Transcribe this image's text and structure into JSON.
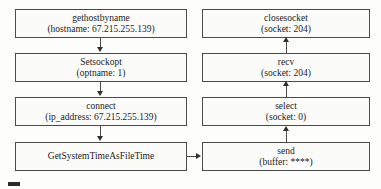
{
  "diagram": {
    "columns": {
      "left": {
        "name": "outbound-connection-sequence",
        "nodes": [
          {
            "title": "gethostbyname",
            "sub": "(hostname: 67.215.255.139)"
          },
          {
            "title": "Setsockopt",
            "sub": "(optname: 1)"
          },
          {
            "title": "connect",
            "sub": "(ip_address: 67.215.255.139)"
          },
          {
            "title": "GetSystemTimeAsFileTime",
            "sub": ""
          }
        ]
      },
      "right": {
        "name": "data-transfer-sequence",
        "nodes": [
          {
            "title": "closesocket",
            "sub": "(socket: 204)"
          },
          {
            "title": "recv",
            "sub": "(socket: 204)"
          },
          {
            "title": "select",
            "sub": "(socket: 0)"
          },
          {
            "title": "send",
            "sub": "(buffer: ****)"
          }
        ]
      }
    },
    "edges": [
      {
        "from": "gethostbyname",
        "to": "Setsockopt",
        "direction": "down"
      },
      {
        "from": "Setsockopt",
        "to": "connect",
        "direction": "down"
      },
      {
        "from": "connect",
        "to": "GetSystemTimeAsFileTime",
        "direction": "down"
      },
      {
        "from": "GetSystemTimeAsFileTime",
        "to": "send",
        "direction": "right"
      },
      {
        "from": "send",
        "to": "select",
        "direction": "up"
      },
      {
        "from": "select",
        "to": "recv",
        "direction": "up"
      },
      {
        "from": "recv",
        "to": "closesocket",
        "direction": "up"
      }
    ]
  },
  "colors": {
    "border": "#4a4a4a",
    "arrow": "#2f2f2f",
    "box_fill": "#fbfbfa",
    "text": "#1b1b1b",
    "background": "#fdfdfc"
  },
  "caption": {
    "text": ""
  }
}
